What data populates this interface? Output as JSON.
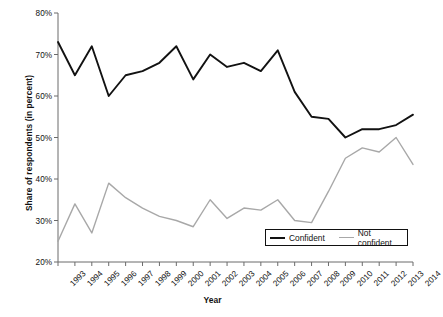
{
  "chart_data": {
    "type": "line",
    "title": "",
    "xlabel": "Year",
    "ylabel": "Share of respondents (in percent)",
    "x": [
      "1993",
      "1994",
      "1995",
      "1996",
      "1997",
      "1998",
      "1999",
      "2000",
      "2001",
      "2002",
      "2003",
      "2004",
      "2005",
      "2006",
      "2007",
      "2008",
      "2009",
      "2010",
      "2011",
      "2012",
      "2013",
      "2014"
    ],
    "ylim": [
      20,
      80
    ],
    "yticks": [
      20,
      30,
      40,
      50,
      60,
      70,
      80
    ],
    "ytick_labels": [
      "20%",
      "30%",
      "40%",
      "50%",
      "60%",
      "70%",
      "80%"
    ],
    "grid": false,
    "legend_position": "inside-bottom-right",
    "series": [
      {
        "name": "Confident",
        "color": "#121212",
        "values": [
          73,
          65,
          72,
          60,
          65,
          66,
          68,
          72,
          64,
          70,
          67,
          68,
          66,
          71,
          61,
          55,
          54.5,
          50,
          52,
          52,
          53,
          55.5
        ]
      },
      {
        "name": "Not confident",
        "color": "#a8a8a8",
        "values": [
          25,
          34,
          27,
          39,
          35.5,
          33,
          31,
          30,
          28.5,
          35,
          30.5,
          33,
          32.5,
          35,
          30,
          29.5,
          37,
          45,
          47.5,
          46.5,
          50,
          43.5
        ]
      }
    ]
  },
  "axes": {
    "y_title": "Share of respondents (in percent)",
    "x_title": "Year"
  },
  "legend": {
    "entries": [
      {
        "label": "Confident",
        "color": "#121212"
      },
      {
        "label": "Not confident",
        "color": "#a8a8a8"
      }
    ]
  }
}
